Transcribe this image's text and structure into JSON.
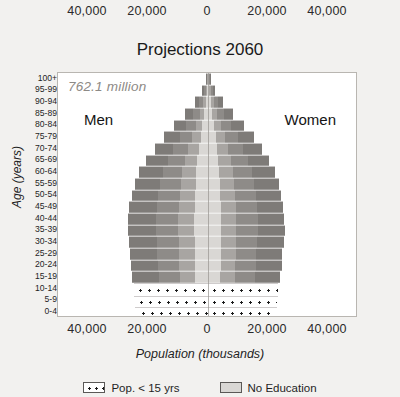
{
  "chart": {
    "title": "Projections 2060",
    "annotation": "762.1 million",
    "men_label": "Men",
    "women_label": "Women",
    "x_axis_title": "Population (thousands)",
    "y_axis_title": "Age (years)"
  },
  "legend": {
    "items": [
      {
        "label": "Pop. < 15 yrs",
        "swatch": "dotted",
        "color": "#ffffff"
      },
      {
        "label": "No Education",
        "swatch": "solid",
        "color": "#d9d7d4"
      }
    ]
  },
  "chart_data": {
    "type": "bar",
    "subtype": "population-pyramid",
    "title": "Projections 2060",
    "xlabel": "Population (thousands)",
    "ylabel": "Age (years)",
    "annotation": "762.1 million",
    "grid": false,
    "legend_position": "bottom",
    "xlim": [
      -50000,
      50000
    ],
    "xticks": [
      40000,
      20000,
      0,
      20000,
      40000
    ],
    "xtick_labels": [
      "40,000",
      "20,000",
      "0",
      "20,000",
      "40,000"
    ],
    "categories": [
      "0-4",
      "5-9",
      "10-14",
      "15-19",
      "20-24",
      "25-29",
      "30-34",
      "35-39",
      "40-44",
      "45-49",
      "50-54",
      "55-59",
      "60-64",
      "65-69",
      "70-74",
      "75-79",
      "80-84",
      "85-89",
      "90-94",
      "95-99",
      "100+"
    ],
    "series": [
      {
        "name": "Men",
        "side": "left",
        "values": [
          23800,
          24200,
          24600,
          25200,
          25800,
          26000,
          26400,
          26800,
          26600,
          26200,
          25400,
          24400,
          23000,
          20600,
          17800,
          14600,
          11200,
          7600,
          4400,
          2000,
          700
        ]
      },
      {
        "name": "Women",
        "side": "right",
        "values": [
          22600,
          23000,
          23400,
          24000,
          24600,
          24800,
          25200,
          25600,
          25400,
          25000,
          24400,
          23600,
          22400,
          20400,
          18000,
          15200,
          12000,
          8400,
          5000,
          2400,
          900
        ]
      }
    ],
    "education_strata": [
      {
        "name": "No Education",
        "color": "#d9d7d4",
        "share": 0.17
      },
      {
        "name": "Education stratum inner",
        "color": "#a8a5a2",
        "share": 0.2
      },
      {
        "name": "Education stratum mid",
        "color": "#8e8b88",
        "share": 0.28
      },
      {
        "name": "Education stratum outer",
        "color": "#7e7b78",
        "share": 0.35
      }
    ],
    "under15_pattern": "dotted",
    "under15_categories": [
      "0-4",
      "5-9",
      "10-14"
    ]
  }
}
